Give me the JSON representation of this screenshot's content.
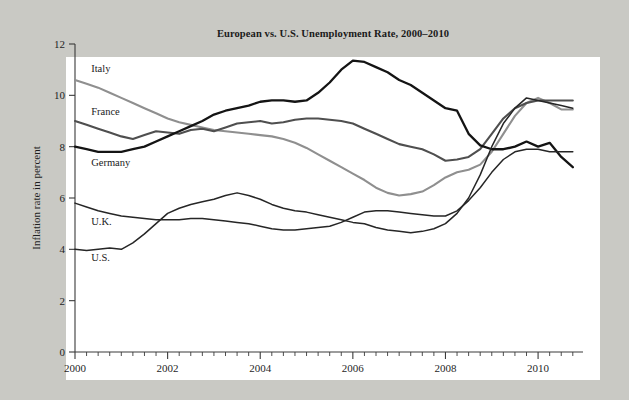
{
  "chart_data": {
    "type": "line",
    "title": "European vs. U.S. Unemployment Rate, 2000–2010",
    "xlabel": "",
    "ylabel": "Inflation rate in percent",
    "xlim": [
      2000,
      2010.97
    ],
    "ylim": [
      0,
      12
    ],
    "y_ticks": [
      0,
      2,
      4,
      6,
      8,
      10,
      12
    ],
    "y_tick_labels": [
      "0",
      "2",
      "4",
      "6",
      "8",
      "10",
      "12"
    ],
    "x_ticks": [
      2000,
      2002,
      2004,
      2006,
      2008,
      2010
    ],
    "x_tick_labels": [
      "2000",
      "2002",
      "2004",
      "2006",
      "2008",
      "2010"
    ],
    "x_minor_step": 0.25,
    "grid": false,
    "legend": "inline-labels",
    "series": [
      {
        "name": "Italy",
        "color": "#8f8f8f",
        "width": 2.1,
        "label_x": 2000.35,
        "label_y": 10.9,
        "x": [
          2000,
          2000.25,
          2000.5,
          2000.75,
          2001,
          2001.25,
          2001.5,
          2001.75,
          2002,
          2002.25,
          2002.5,
          2002.75,
          2003,
          2003.25,
          2003.5,
          2003.75,
          2004,
          2004.25,
          2004.5,
          2004.75,
          2005,
          2005.25,
          2005.5,
          2005.75,
          2006,
          2006.25,
          2006.5,
          2006.75,
          2007,
          2007.25,
          2007.5,
          2007.75,
          2008,
          2008.25,
          2008.5,
          2008.75,
          2009,
          2009.25,
          2009.5,
          2009.75,
          2010,
          2010.25,
          2010.5,
          2010.75
        ],
        "y": [
          10.6,
          10.45,
          10.3,
          10.1,
          9.9,
          9.7,
          9.5,
          9.3,
          9.1,
          8.95,
          8.85,
          8.75,
          8.65,
          8.6,
          8.55,
          8.5,
          8.45,
          8.4,
          8.3,
          8.15,
          7.95,
          7.7,
          7.45,
          7.2,
          6.95,
          6.7,
          6.4,
          6.2,
          6.1,
          6.15,
          6.25,
          6.5,
          6.8,
          7.0,
          7.1,
          7.3,
          7.8,
          8.5,
          9.2,
          9.7,
          9.9,
          9.7,
          9.45,
          9.45
        ]
      },
      {
        "name": "France",
        "color": "#4f4f4f",
        "width": 2.1,
        "label_x": 2000.35,
        "label_y": 9.25,
        "x": [
          2000,
          2000.25,
          2000.5,
          2000.75,
          2001,
          2001.25,
          2001.5,
          2001.75,
          2002,
          2002.25,
          2002.5,
          2002.75,
          2003,
          2003.25,
          2003.5,
          2003.75,
          2004,
          2004.25,
          2004.5,
          2004.75,
          2005,
          2005.25,
          2005.5,
          2005.75,
          2006,
          2006.25,
          2006.5,
          2006.75,
          2007,
          2007.25,
          2007.5,
          2007.75,
          2008,
          2008.25,
          2008.5,
          2008.75,
          2009,
          2009.25,
          2009.5,
          2009.75,
          2010,
          2010.25,
          2010.5,
          2010.75
        ],
        "y": [
          9.0,
          8.85,
          8.7,
          8.55,
          8.4,
          8.3,
          8.45,
          8.6,
          8.55,
          8.5,
          8.65,
          8.7,
          8.6,
          8.75,
          8.9,
          8.95,
          9.0,
          8.9,
          8.95,
          9.05,
          9.1,
          9.1,
          9.05,
          9.0,
          8.9,
          8.7,
          8.5,
          8.3,
          8.1,
          8.0,
          7.9,
          7.7,
          7.45,
          7.5,
          7.6,
          7.9,
          8.5,
          9.1,
          9.5,
          9.7,
          9.8,
          9.8,
          9.8,
          9.8
        ]
      },
      {
        "name": "Germany",
        "color": "#141414",
        "width": 2.3,
        "label_x": 2000.35,
        "label_y": 7.25,
        "x": [
          2000,
          2000.25,
          2000.5,
          2000.75,
          2001,
          2001.25,
          2001.5,
          2001.75,
          2002,
          2002.25,
          2002.5,
          2002.75,
          2003,
          2003.25,
          2003.5,
          2003.75,
          2004,
          2004.25,
          2004.5,
          2004.75,
          2005,
          2005.25,
          2005.5,
          2005.75,
          2006,
          2006.25,
          2006.5,
          2006.75,
          2007,
          2007.25,
          2007.5,
          2007.75,
          2008,
          2008.25,
          2008.5,
          2008.75,
          2009,
          2009.25,
          2009.5,
          2009.75,
          2010,
          2010.25,
          2010.5,
          2010.75
        ],
        "y": [
          8.0,
          7.9,
          7.8,
          7.8,
          7.8,
          7.9,
          8.0,
          8.2,
          8.4,
          8.6,
          8.8,
          9.0,
          9.25,
          9.4,
          9.5,
          9.6,
          9.75,
          9.8,
          9.8,
          9.75,
          9.8,
          10.1,
          10.5,
          11.0,
          11.35,
          11.3,
          11.1,
          10.9,
          10.6,
          10.4,
          10.1,
          9.8,
          9.5,
          9.4,
          8.5,
          8.05,
          7.9,
          7.9,
          8.0,
          8.2,
          8.0,
          8.15,
          7.6,
          7.2
        ]
      },
      {
        "name": "U.K.",
        "color": "#262626",
        "width": 1.5,
        "label_x": 2000.35,
        "label_y": 4.95,
        "x": [
          2000,
          2000.25,
          2000.5,
          2000.75,
          2001,
          2001.25,
          2001.5,
          2001.75,
          2002,
          2002.25,
          2002.5,
          2002.75,
          2003,
          2003.25,
          2003.5,
          2003.75,
          2004,
          2004.25,
          2004.5,
          2004.75,
          2005,
          2005.25,
          2005.5,
          2005.75,
          2006,
          2006.25,
          2006.5,
          2006.75,
          2007,
          2007.25,
          2007.5,
          2007.75,
          2008,
          2008.25,
          2008.5,
          2008.75,
          2009,
          2009.25,
          2009.5,
          2009.75,
          2010,
          2010.25,
          2010.5,
          2010.75
        ],
        "y": [
          5.8,
          5.65,
          5.5,
          5.4,
          5.3,
          5.25,
          5.2,
          5.15,
          5.15,
          5.15,
          5.2,
          5.2,
          5.15,
          5.1,
          5.05,
          5.0,
          4.9,
          4.8,
          4.75,
          4.75,
          4.8,
          4.85,
          4.9,
          5.05,
          5.25,
          5.45,
          5.5,
          5.5,
          5.45,
          5.4,
          5.35,
          5.3,
          5.3,
          5.5,
          5.9,
          6.4,
          7.0,
          7.5,
          7.8,
          7.9,
          7.9,
          7.8,
          7.8,
          7.8
        ]
      },
      {
        "name": "U.S.",
        "color": "#262626",
        "width": 1.5,
        "label_x": 2000.35,
        "label_y": 3.55,
        "x": [
          2000,
          2000.25,
          2000.5,
          2000.75,
          2001,
          2001.25,
          2001.5,
          2001.75,
          2002,
          2002.25,
          2002.5,
          2002.75,
          2003,
          2003.25,
          2003.5,
          2003.75,
          2004,
          2004.25,
          2004.5,
          2004.75,
          2005,
          2005.25,
          2005.5,
          2005.75,
          2006,
          2006.25,
          2006.5,
          2006.75,
          2007,
          2007.25,
          2007.5,
          2007.75,
          2008,
          2008.25,
          2008.5,
          2008.75,
          2009,
          2009.25,
          2009.5,
          2009.75,
          2010,
          2010.25,
          2010.5,
          2010.75
        ],
        "y": [
          4.0,
          3.95,
          4.0,
          4.05,
          4.0,
          4.25,
          4.6,
          5.0,
          5.4,
          5.6,
          5.75,
          5.85,
          5.95,
          6.1,
          6.2,
          6.1,
          5.95,
          5.75,
          5.6,
          5.5,
          5.45,
          5.35,
          5.25,
          5.15,
          5.05,
          5.0,
          4.85,
          4.75,
          4.7,
          4.65,
          4.7,
          4.8,
          5.0,
          5.4,
          6.0,
          6.9,
          8.0,
          8.9,
          9.5,
          9.9,
          9.8,
          9.7,
          9.6,
          9.5
        ]
      }
    ]
  }
}
